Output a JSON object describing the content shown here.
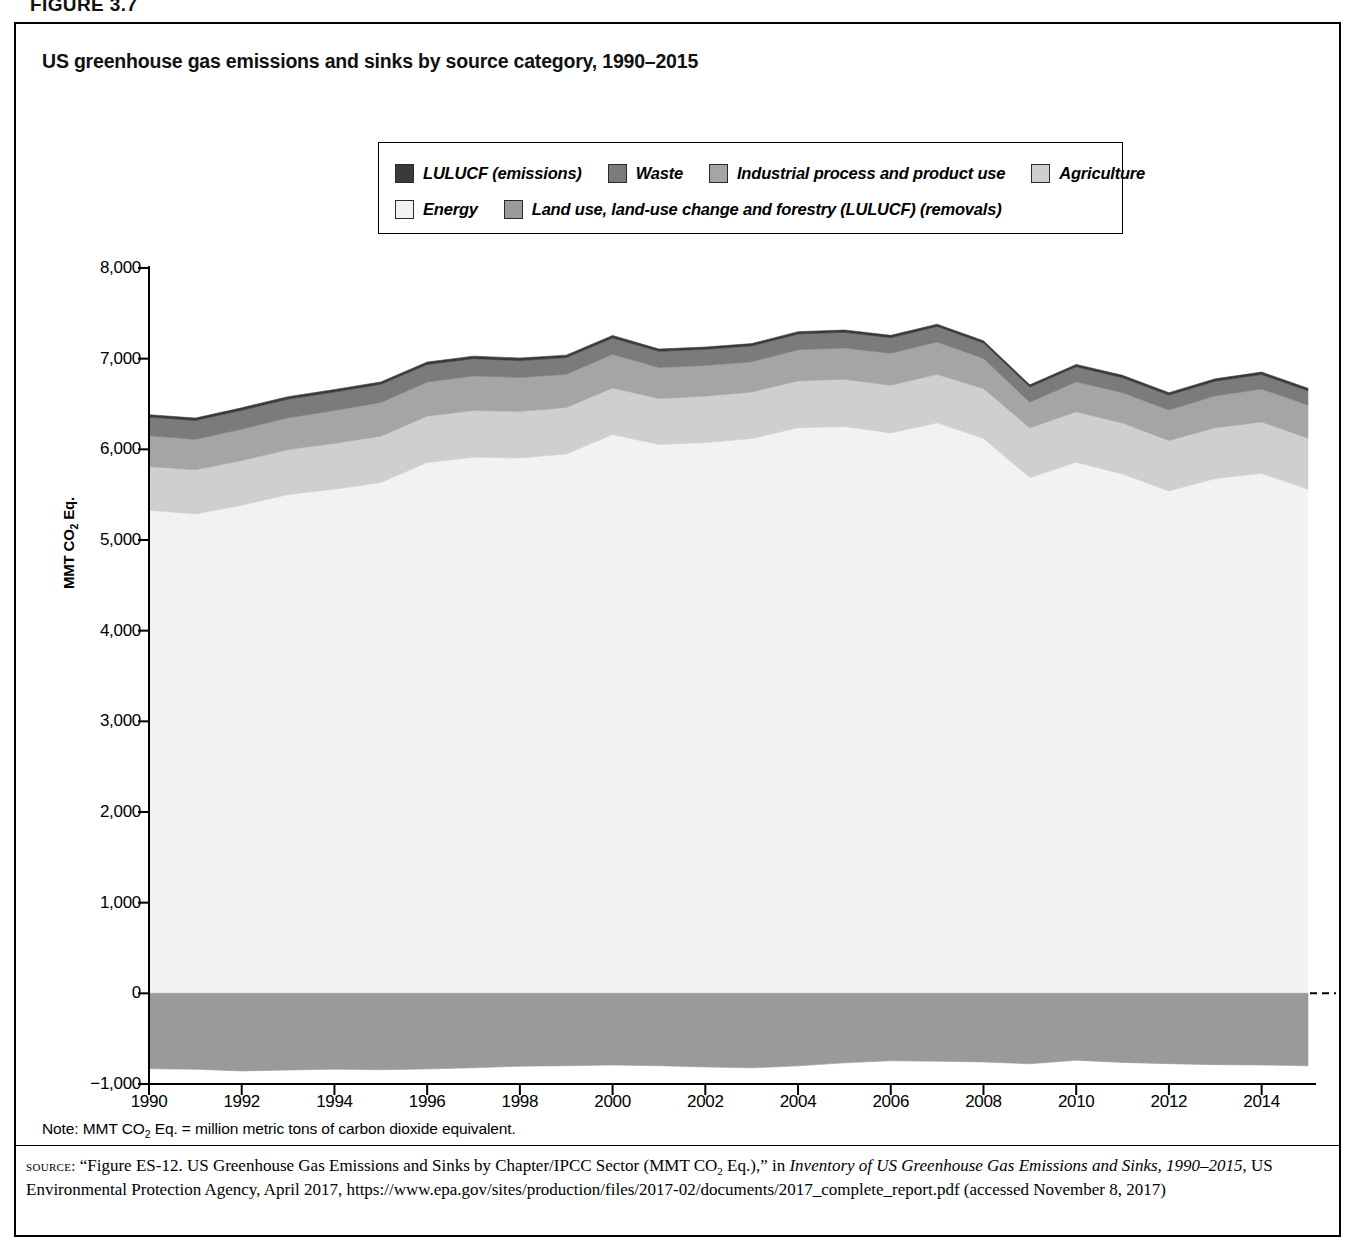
{
  "figure_label": "FIGURE 3.7",
  "chart_title": "US greenhouse gas emissions and sinks by source category, 1990–2015",
  "legend": {
    "items": [
      {
        "label": "LULUCF (emissions)",
        "color": "#3a3a3a",
        "row": 0
      },
      {
        "label": "Waste",
        "color": "#7b7b7b",
        "row": 0
      },
      {
        "label": "Industrial process and product use",
        "color": "#a5a5a5",
        "row": 0
      },
      {
        "label": "Agriculture",
        "color": "#cfcfcf",
        "row": 0
      },
      {
        "label": "Energy",
        "color": "#f2f2f2",
        "row": 1
      },
      {
        "label": "Land use, land-use change and forestry (LULUCF) (removals)",
        "color": "#9a9a9a",
        "row": 1
      }
    ]
  },
  "note": "Note: MMT CO2 Eq. = million metric tons of carbon dioxide equivalent.",
  "note_parts": {
    "prefix": "Note: MMT CO",
    "sub": "2",
    "suffix": " Eq. = million metric tons of carbon dioxide equivalent."
  },
  "source": {
    "label": "source:",
    "text": "“Figure ES-12. US Greenhouse Gas Emissions and Sinks by Chapter/IPCC Sector (MMT CO2 Eq.),” in Inventory of US Greenhouse Gas Emissions and Sinks, 1990–2015, US Environmental Protection Agency, April 2017, https://www.epa.gov/sites/production/files/2017-02/documents/2017_complete_report.pdf (accessed November 8, 2017)",
    "seg1": "“Figure ES-12. US Greenhouse Gas Emissions and Sinks by Chapter/IPCC Sector (MMT CO",
    "seg1_sub": "2",
    "seg2": " Eq.),” in ",
    "italic1": "Inventory of US Greenhouse Gas Emissions and Sinks, 1990–2015",
    "seg3": ", US Environmental Protection Agency, April 2017, https://www.epa.gov/sites/production/files/2017-02/documents/2017_complete_report.pdf (accessed November 8, 2017)"
  },
  "chart_data": {
    "type": "area",
    "stacked": true,
    "title": "US greenhouse gas emissions and sinks by source category, 1990–2015",
    "xlabel": "",
    "ylabel": "MMT CO2 Eq.",
    "ylabel_parts": {
      "prefix": "MMT CO",
      "sub": "2",
      "suffix": " Eq."
    },
    "xlim": [
      1990,
      2015
    ],
    "ylim": [
      -1000,
      8000
    ],
    "yticks": [
      8000,
      7000,
      6000,
      5000,
      4000,
      3000,
      2000,
      1000,
      0,
      -1000
    ],
    "ytick_labels": [
      "8,000",
      "7,000",
      "6,000",
      "5,000",
      "4,000",
      "3,000",
      "2,000",
      "1,000",
      "0",
      "−1,000"
    ],
    "xticks": [
      1990,
      1992,
      1994,
      1996,
      1998,
      2000,
      2002,
      2004,
      2006,
      2008,
      2010,
      2012,
      2014
    ],
    "xtick_labels": [
      "1990",
      "1992",
      "1994",
      "1996",
      "1998",
      "2000",
      "2002",
      "2004",
      "2006",
      "2008",
      "2010",
      "2012",
      "2014"
    ],
    "grid": false,
    "legend_position": "top-center",
    "x": [
      1990,
      1991,
      1992,
      1993,
      1994,
      1995,
      1996,
      1997,
      1998,
      1999,
      2000,
      2001,
      2002,
      2003,
      2004,
      2005,
      2006,
      2007,
      2008,
      2009,
      2010,
      2011,
      2012,
      2013,
      2014,
      2015
    ],
    "series": [
      {
        "name": "Energy",
        "color": "#f2f2f2",
        "values": [
          5329,
          5287,
          5383,
          5502,
          5561,
          5633,
          5856,
          5913,
          5905,
          5949,
          6163,
          6053,
          6074,
          6119,
          6239,
          6251,
          6181,
          6292,
          6120,
          5688,
          5858,
          5729,
          5541,
          5678,
          5735,
          5560
        ]
      },
      {
        "name": "Agriculture",
        "color": "#cfcfcf",
        "values": [
          482,
          488,
          494,
          495,
          505,
          512,
          511,
          515,
          514,
          512,
          514,
          508,
          512,
          514,
          516,
          521,
          526,
          535,
          550,
          549,
          557,
          561,
          557,
          561,
          567,
          563
        ]
      },
      {
        "name": "Industrial process and product use",
        "color": "#a5a5a5",
        "values": [
          339,
          336,
          346,
          351,
          362,
          372,
          375,
          382,
          374,
          367,
          372,
          342,
          340,
          333,
          344,
          346,
          354,
          357,
          333,
          282,
          330,
          335,
          337,
          351,
          363,
          365
        ]
      },
      {
        "name": "Waste",
        "color": "#7b7b7b",
        "values": [
          206,
          208,
          208,
          206,
          204,
          200,
          194,
          190,
          186,
          184,
          180,
          178,
          177,
          175,
          173,
          172,
          171,
          171,
          170,
          168,
          166,
          165,
          163,
          162,
          160,
          158
        ]
      },
      {
        "name": "LULUCF (emissions)",
        "color": "#3a3a3a",
        "values": [
          26,
          26,
          27,
          27,
          27,
          26,
          26,
          28,
          28,
          27,
          27,
          25,
          25,
          25,
          26,
          26,
          25,
          25,
          24,
          24,
          26,
          26,
          27,
          26,
          27,
          27
        ]
      },
      {
        "name": "Land use, land-use change and forestry (LULUCF) (removals)",
        "color": "#9a9a9a",
        "negative": true,
        "values": [
          -831,
          -838,
          -856,
          -846,
          -836,
          -843,
          -834,
          -821,
          -803,
          -799,
          -790,
          -799,
          -812,
          -822,
          -800,
          -767,
          -743,
          -749,
          -757,
          -777,
          -738,
          -762,
          -776,
          -787,
          -790,
          -800
        ]
      }
    ]
  }
}
